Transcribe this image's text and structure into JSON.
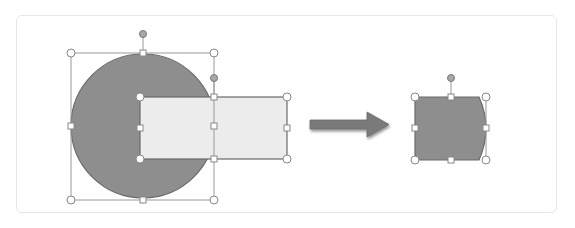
{
  "diagram": {
    "colors": {
      "panel_border": "#e6e6e6",
      "circle_fill": "#8e8e8e",
      "rect_fill": "#ececec",
      "outline": "#6a6a6a",
      "selection_line": "#9a9a9a",
      "handle_fill": "#ffffff",
      "rotation_handle_fill": "#a8a8a8",
      "arrow_fill": "#7a7a7a",
      "result_fill": "#8e8e8e"
    },
    "before": {
      "circle": {
        "label": "Circle shape",
        "cx": 143,
        "cy": 126,
        "r": 72
      },
      "rectangle": {
        "label": "Rectangle shape",
        "x": 140,
        "y": 97,
        "w": 147,
        "h": 62
      }
    },
    "arrow": {
      "label": "Result arrow"
    },
    "after": {
      "result_shape": {
        "label": "Intersected shape",
        "x": 415,
        "y": 97,
        "w": 71,
        "h": 63
      }
    }
  }
}
